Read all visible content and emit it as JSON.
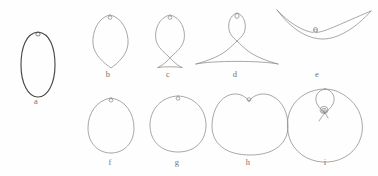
{
  "figure": {
    "background_color": "#fefefe",
    "stroke_color": "#8d8a85",
    "stroke_color_dark": "#4a4743",
    "label_color": "#76736e",
    "width": 378,
    "height": 176,
    "panels": [
      {
        "id": "a",
        "label": "a",
        "label_x": 36,
        "label_y": 101,
        "shape": "tall-ellipse",
        "description": "tall narrow closed oval with small node loop at top",
        "emphasis": "dark",
        "node": {
          "cx": 38,
          "cy": 34,
          "r": 2.0
        }
      },
      {
        "id": "b",
        "label": "b",
        "label_x": 108,
        "label_y": 74,
        "shape": "teardrop-down",
        "description": "leaf / teardrop loop tapering to a point at the bottom, node loop at top",
        "emphasis": "light",
        "node": {
          "cx": 110,
          "cy": 18,
          "r": 2.0
        }
      },
      {
        "id": "c",
        "label": "c",
        "label_x": 168,
        "label_y": 74,
        "shape": "fish-crossing",
        "description": "loop at top whose tails cross below and splay into a small open triangle",
        "emphasis": "light",
        "node": {
          "cx": 170,
          "cy": 18,
          "r": 2.0
        }
      },
      {
        "id": "d",
        "label": "d",
        "label_x": 235,
        "label_y": 74,
        "shape": "narrow-loop-wide-arch",
        "description": "narrow vertical loop at top opening into a wide shallow triangular arch",
        "emphasis": "light",
        "node": {
          "cx": 237,
          "cy": 17,
          "r": 2.2
        }
      },
      {
        "id": "e",
        "label": "e",
        "label_x": 317,
        "label_y": 74,
        "shape": "double-shallow-curve",
        "description": "two wide shallow downward curves meeting at a tiny node loop at centre top",
        "emphasis": "light",
        "node": {
          "cx": 317,
          "cy": 13,
          "r": 2.2
        }
      },
      {
        "id": "f",
        "label": "f",
        "label_x": 110,
        "label_y": 162,
        "shape": "egg",
        "description": "egg shaped closed curve, narrower at the top, node loop at top",
        "emphasis": "light",
        "node": {
          "cx": 111,
          "cy": 101,
          "r": 2.0
        }
      },
      {
        "id": "g",
        "label": "g",
        "label_x": 177,
        "label_y": 162,
        "shape": "circle",
        "description": "near circular closed curve with node loop at top",
        "emphasis": "light",
        "node": {
          "cx": 178,
          "cy": 99,
          "r": 2.0
        }
      },
      {
        "id": "h",
        "label": "h",
        "label_x": 248,
        "label_y": 162,
        "shape": "heart-dimple",
        "description": "large rounded curve with a dimple / cusp indentation at the top, node loop in the dimple",
        "emphasis": "light",
        "node": {
          "cx": 249,
          "cy": 99,
          "r": 2.0
        }
      },
      {
        "id": "i",
        "label": "i",
        "label_x": 325,
        "label_y": 162,
        "shape": "circle-with-inner-loop",
        "description": "large circle whose top folds inward forming an inner loop with a small spiral node",
        "emphasis": "light",
        "node": {
          "cx": 325,
          "cy": 103,
          "r": 3.0
        }
      }
    ]
  }
}
